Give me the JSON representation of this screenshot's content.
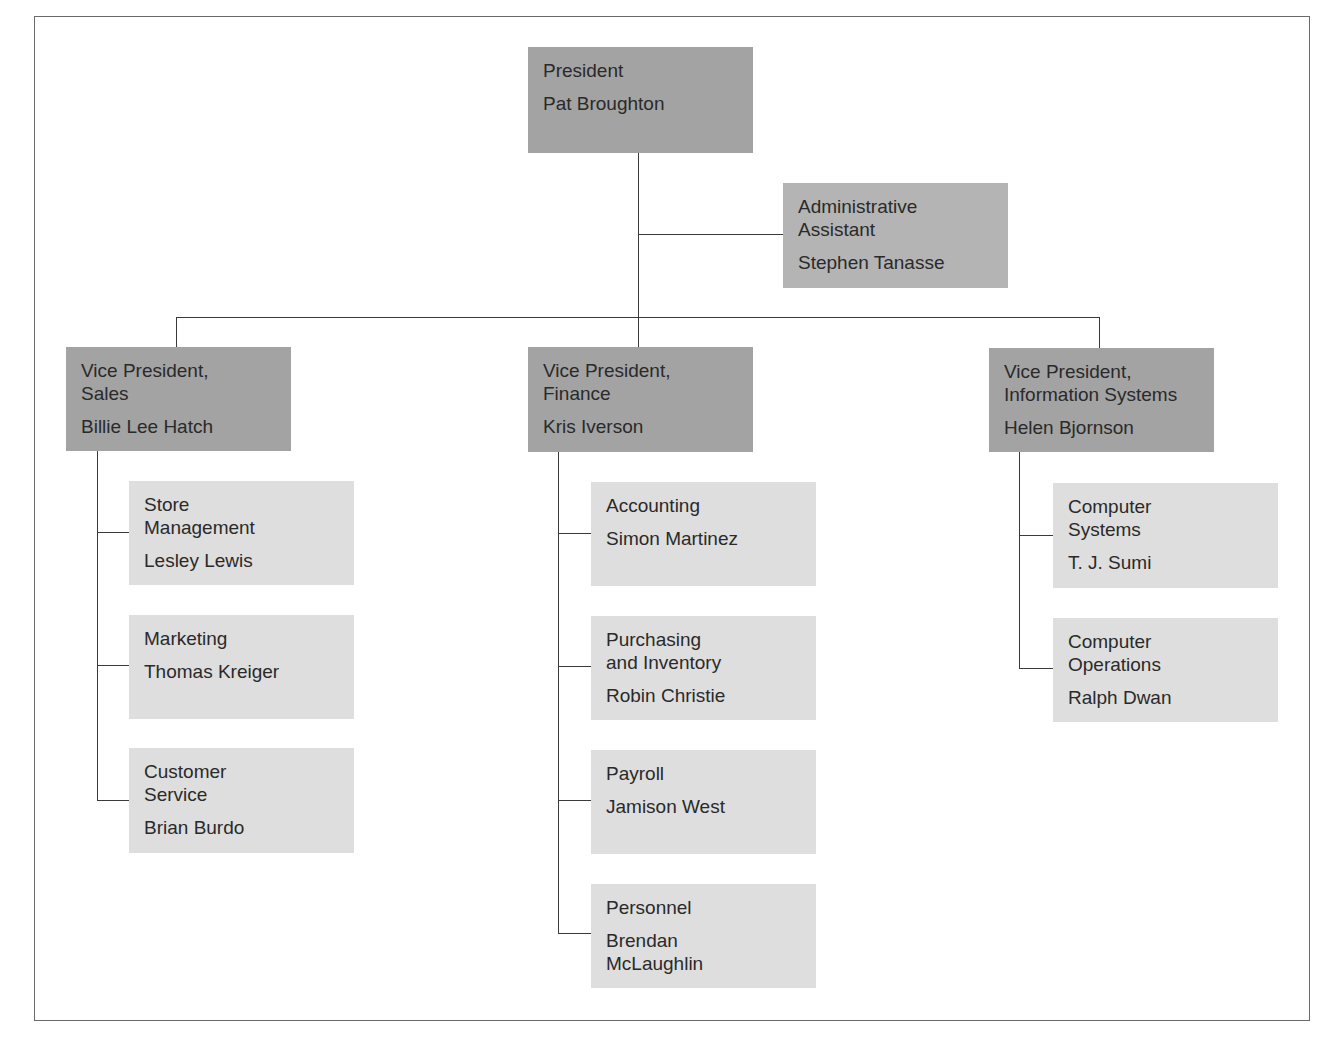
{
  "org_chart": {
    "president": {
      "title": "President",
      "name": "Pat Broughton"
    },
    "assistant": {
      "title": "Administrative\nAssistant",
      "name": "Stephen Tanasse"
    },
    "vps": [
      {
        "title": "Vice President,\nSales",
        "name": "Billie Lee Hatch",
        "departments": [
          {
            "title": "Store\nManagement",
            "name": "Lesley Lewis"
          },
          {
            "title": "Marketing",
            "name": "Thomas Kreiger"
          },
          {
            "title": "Customer\nService",
            "name": "Brian Burdo"
          }
        ]
      },
      {
        "title": "Vice President,\nFinance",
        "name": "Kris Iverson",
        "departments": [
          {
            "title": "Accounting",
            "name": "Simon Martinez"
          },
          {
            "title": "Purchasing\nand Inventory",
            "name": "Robin Christie"
          },
          {
            "title": "Payroll",
            "name": "Jamison West"
          },
          {
            "title": "Personnel",
            "name": "Brendan\nMcLaughlin"
          }
        ]
      },
      {
        "title": "Vice President,\nInformation Systems",
        "name": "Helen Bjornson",
        "departments": [
          {
            "title": "Computer\nSystems",
            "name": "T. J. Sumi"
          },
          {
            "title": "Computer\nOperations",
            "name": "Ralph Dwan"
          }
        ]
      }
    ]
  },
  "colors": {
    "executive_box": "#a3a3a3",
    "department_box": "#dedede",
    "connector": "#3a3a3a"
  }
}
